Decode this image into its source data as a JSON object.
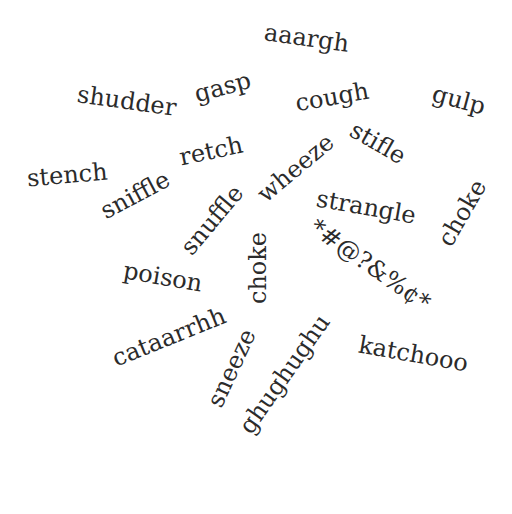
{
  "word_cloud": {
    "text_color": "#2b2b2b",
    "background": "#ffffff",
    "words": [
      {
        "text": "aaargh",
        "x": 306,
        "y": 38,
        "rot": 8,
        "size": 24
      },
      {
        "text": "shudder",
        "x": 127,
        "y": 101,
        "rot": 8,
        "size": 24
      },
      {
        "text": "gasp",
        "x": 222,
        "y": 87,
        "rot": -15,
        "size": 24
      },
      {
        "text": "cough",
        "x": 332,
        "y": 97,
        "rot": -10,
        "size": 24
      },
      {
        "text": "gulp",
        "x": 459,
        "y": 100,
        "rot": 15,
        "size": 24
      },
      {
        "text": "retch",
        "x": 211,
        "y": 151,
        "rot": -12,
        "size": 24
      },
      {
        "text": "stifle",
        "x": 378,
        "y": 143,
        "rot": 30,
        "size": 24
      },
      {
        "text": "stench",
        "x": 67,
        "y": 175,
        "rot": -5,
        "size": 24
      },
      {
        "text": "sniffle",
        "x": 135,
        "y": 195,
        "rot": -28,
        "size": 24
      },
      {
        "text": "wheeze",
        "x": 295,
        "y": 168,
        "rot": -40,
        "size": 24
      },
      {
        "text": "snuffle",
        "x": 212,
        "y": 220,
        "rot": -50,
        "size": 24
      },
      {
        "text": "strangle",
        "x": 366,
        "y": 207,
        "rot": 10,
        "size": 24
      },
      {
        "text": "choke",
        "x": 462,
        "y": 213,
        "rot": -60,
        "size": 24
      },
      {
        "text": "choke",
        "x": 258,
        "y": 268,
        "rot": -90,
        "size": 24
      },
      {
        "text": "poison",
        "x": 163,
        "y": 277,
        "rot": 10,
        "size": 24
      },
      {
        "text": "*#@?&%¢*",
        "x": 370,
        "y": 265,
        "rot": 35,
        "size": 24
      },
      {
        "text": "cataarrhh",
        "x": 169,
        "y": 337,
        "rot": -22,
        "size": 24
      },
      {
        "text": "sneeze",
        "x": 231,
        "y": 368,
        "rot": -65,
        "size": 24
      },
      {
        "text": "ghughughu",
        "x": 284,
        "y": 374,
        "rot": -55,
        "size": 24
      },
      {
        "text": "katchooo",
        "x": 413,
        "y": 354,
        "rot": 10,
        "size": 24
      }
    ]
  }
}
